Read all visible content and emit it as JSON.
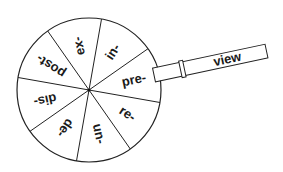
{
  "diagram": {
    "wheel": {
      "prefixes": [
        {
          "label": "in-",
          "angle": -57
        },
        {
          "label": "pre-",
          "angle": -12
        },
        {
          "label": "re-",
          "angle": 33
        },
        {
          "label": "un-",
          "angle": 78
        },
        {
          "label": "de-",
          "angle": 123
        },
        {
          "label": "dis-",
          "angle": 168
        },
        {
          "label": "post-",
          "angle": 213
        },
        {
          "label": "ex-",
          "angle": 258
        }
      ]
    },
    "strip": {
      "word": "view"
    }
  }
}
